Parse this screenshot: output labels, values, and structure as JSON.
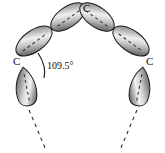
{
  "figure": {
    "background_color": "#ffffff",
    "orbital_outline_color": "#1a1a1a",
    "orbital_fill_dark": "#4a4a4a",
    "orbital_fill_light": "#e8e8e8",
    "dashed_line_color": "#2b2b2b",
    "angle": {
      "value": "109.5°",
      "arc_color": "#111111"
    },
    "atom_labels": [
      {
        "text": "C",
        "position": "top-center"
      },
      {
        "text": "C",
        "position": "left-middle"
      },
      {
        "text": "C",
        "position": "right-middle"
      }
    ],
    "orbitals": [
      {
        "name": "upper-left-outer-lobe",
        "type": "sp3-lobe"
      },
      {
        "name": "upper-left-inner-lobe",
        "type": "sp3-lobe"
      },
      {
        "name": "upper-right-inner-lobe",
        "type": "sp3-lobe"
      },
      {
        "name": "upper-right-outer-lobe",
        "type": "sp3-lobe"
      },
      {
        "name": "lower-left-lobe",
        "type": "sp3-lobe"
      },
      {
        "name": "lower-right-lobe",
        "type": "sp3-lobe"
      }
    ],
    "bond_continuations": [
      {
        "name": "left-bond-dashed",
        "style": "dashed"
      },
      {
        "name": "right-bond-dashed",
        "style": "dashed"
      }
    ]
  }
}
